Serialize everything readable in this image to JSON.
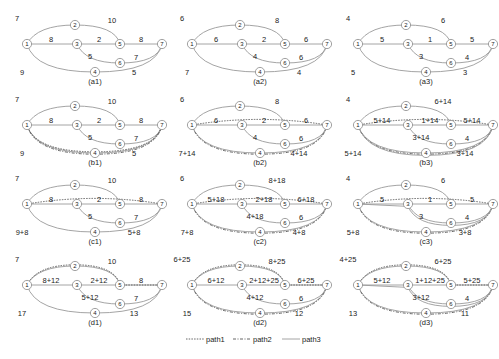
{
  "legend": [
    {
      "label": "path1",
      "style": "dotted"
    },
    {
      "label": "path2",
      "style": "dash-dot"
    },
    {
      "label": "path3",
      "style": "solid"
    }
  ],
  "panels": [
    {
      "id": "a1",
      "col": 0,
      "row": 0,
      "label": "(a1)",
      "w": {
        "12": "7",
        "25": "10",
        "13": "8",
        "35": "2",
        "57": "8",
        "36": "5",
        "67": "7",
        "14": "9",
        "47": "5"
      },
      "paths": []
    },
    {
      "id": "a2",
      "col": 1,
      "row": 0,
      "label": "(a2)",
      "w": {
        "12": "6",
        "25": "8",
        "13": "6",
        "35": "2",
        "57": "6",
        "36": "4",
        "67": "6",
        "14": "7",
        "47": "4"
      },
      "paths": []
    },
    {
      "id": "a3",
      "col": 2,
      "row": 0,
      "label": "(a3)",
      "w": {
        "12": "4",
        "25": "6",
        "13": "5",
        "35": "1",
        "57": "5",
        "36": "3",
        "67": "4",
        "14": "5",
        "47": "3"
      },
      "paths": []
    },
    {
      "id": "b1",
      "col": 0,
      "row": 1,
      "label": "(b1)",
      "w": {
        "12": "7",
        "25": "10",
        "13": "8",
        "35": "2",
        "57": "8",
        "36": "5",
        "67": "7",
        "14": "9",
        "47": "5"
      },
      "paths": [
        "p1-147",
        "p2-147"
      ]
    },
    {
      "id": "b2",
      "col": 1,
      "row": 1,
      "label": "(b2)",
      "w": {
        "12": "6",
        "25": "8",
        "13": "6",
        "35": "2",
        "57": "6",
        "36": "4",
        "67": "6",
        "14": "7+14",
        "47": "4+14"
      },
      "paths": [
        "p1-17",
        "p2-147"
      ]
    },
    {
      "id": "b3",
      "col": 2,
      "row": 1,
      "label": "(b3)",
      "w": {
        "12": "4",
        "25": "6+14",
        "13": "5+14",
        "35": "1+14",
        "57": "5+14",
        "36": "3+14",
        "67": "4",
        "14": "5+14",
        "47": "3+14"
      },
      "paths": [
        "p1-17",
        "p2-147",
        "p3-147"
      ]
    },
    {
      "id": "c1",
      "col": 0,
      "row": 2,
      "label": "(c1)",
      "w": {
        "12": "7",
        "25": "10",
        "13": "8",
        "35": "2",
        "57": "8",
        "36": "5",
        "67": "7",
        "14": "9+8",
        "47": "5+8"
      },
      "paths": [
        "p1-17"
      ]
    },
    {
      "id": "c2",
      "col": 1,
      "row": 2,
      "label": "(c2)",
      "w": {
        "12": "6",
        "25": "8+18",
        "13": "5+18",
        "35": "2+18",
        "57": "6+18",
        "36": "4+18",
        "67": "6",
        "14": "7+8",
        "47": "4+8"
      },
      "paths": [
        "p1-17",
        "p2-147"
      ]
    },
    {
      "id": "c3",
      "col": 2,
      "row": 2,
      "label": "(c3)",
      "w": {
        "12": "4",
        "25": "6",
        "13": "5",
        "35": "1",
        "57": "5",
        "36": "3",
        "67": "4",
        "14": "5+8",
        "47": "3+8"
      },
      "paths": [
        "p1-17",
        "p2-147",
        "p3-1367"
      ]
    },
    {
      "id": "d1",
      "col": 0,
      "row": 3,
      "label": "(d1)",
      "w": {
        "12": "7",
        "25": "10",
        "13": "8+12",
        "35": "2+12",
        "57": "8",
        "36": "5+12",
        "67": "7",
        "14": "17",
        "47": "13"
      },
      "paths": [
        "p1-1257"
      ]
    },
    {
      "id": "d2",
      "col": 1,
      "row": 3,
      "label": "(d2)",
      "w": {
        "12": "6+25",
        "25": "8+25",
        "13": "6+12",
        "35": "2+12+25",
        "57": "6+25",
        "36": "4+12",
        "67": "6",
        "14": "15",
        "47": "12"
      },
      "paths": [
        "p1-1257",
        "p2-147"
      ]
    },
    {
      "id": "d3",
      "col": 2,
      "row": 3,
      "label": "(d3)",
      "w": {
        "12": "4+25",
        "25": "6+25",
        "13": "5+12",
        "35": "1+12+25",
        "57": "5+25",
        "36": "3+12",
        "67": "4",
        "14": "13",
        "47": "11"
      },
      "paths": [
        "p1-1257",
        "p2-147",
        "p3-1367"
      ]
    }
  ],
  "nodes": [
    "1",
    "2",
    "3",
    "4",
    "5",
    "6",
    "7"
  ]
}
